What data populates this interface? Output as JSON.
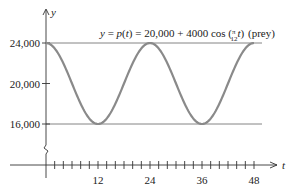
{
  "chart_data": {
    "type": "line",
    "equation": "y = p(t) = 20,000 + 4000 cos (π/12 t)",
    "series_label": "(prey)",
    "xlabel": "t",
    "ylabel": "y",
    "x_ticks": [
      12,
      24,
      36,
      48
    ],
    "x_tick_labels": [
      "12",
      "24",
      "36",
      "48"
    ],
    "x_minor_tick_step": 2,
    "y_ticks": [
      16000,
      20000,
      24000
    ],
    "y_tick_labels": [
      "16,000",
      "20,000",
      "24,000"
    ],
    "xlim": [
      0,
      48
    ],
    "ylim": [
      16000,
      24000
    ],
    "y_axis_break": true,
    "reference_lines": [
      24000,
      16000
    ],
    "series": [
      {
        "name": "prey",
        "x": [
          0,
          6,
          12,
          18,
          24,
          30,
          36,
          42,
          48
        ],
        "values": [
          24000,
          20000,
          16000,
          20000,
          24000,
          20000,
          16000,
          20000,
          24000
        ]
      }
    ],
    "grid": false,
    "colors": {
      "curve": "#8a8a8a",
      "axes": "#333333",
      "reference": "#555555"
    }
  }
}
